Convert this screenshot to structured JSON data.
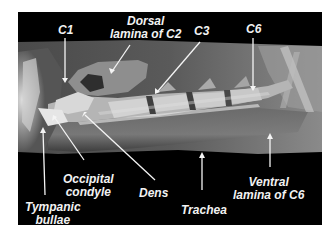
{
  "figure": {
    "type": "lateral cervical radiograph",
    "background": "#000000",
    "labels": {
      "c1": "C1",
      "dorsal_lamina_line1": "Dorsal",
      "dorsal_lamina_line2": "lamina of C2",
      "c3": "C3",
      "c6": "C6",
      "occipital_line1": "Occipital",
      "occipital_line2": "condyle",
      "dens": "Dens",
      "tympanic_line1": "Tympanic",
      "tympanic_line2": "bullae",
      "trachea": "Trachea",
      "ventral_line1": "Ventral",
      "ventral_line2": "lamina of C6"
    }
  }
}
